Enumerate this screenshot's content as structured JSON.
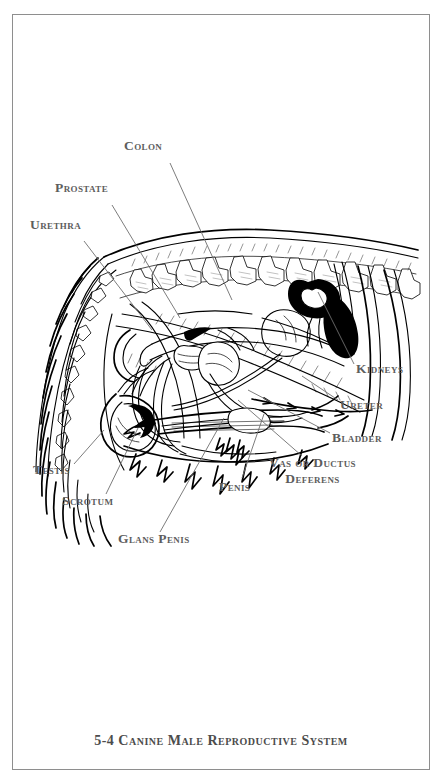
{
  "plate": {
    "caption": "5-4 Canine Male Reproductive System",
    "caption_number": "5-4",
    "caption_title": "Canine Male Reproductive System",
    "background_color": "#ffffff",
    "frame_color": "#8e8e8e",
    "label_color": "#5d5d5d",
    "ink_color": "#000000"
  },
  "labels": [
    {
      "id": "colon",
      "text": "Colon",
      "x": 124,
      "y": 145,
      "lead": [
        170,
        163,
        232,
        300
      ]
    },
    {
      "id": "prostate",
      "text": "Prostate",
      "x": 55,
      "y": 187,
      "lead": [
        112,
        205,
        180,
        318
      ]
    },
    {
      "id": "urethra",
      "text": "Urethra",
      "x": 30,
      "y": 224,
      "lead": [
        84,
        241,
        152,
        330
      ]
    },
    {
      "id": "kidneys",
      "text": "Kidneys",
      "x": 356,
      "y": 368,
      "lead": [
        354,
        368,
        320,
        290
      ]
    },
    {
      "id": "ureter",
      "text": "Ureter",
      "x": 340,
      "y": 404,
      "lead": [
        338,
        404,
        300,
        372
      ]
    },
    {
      "id": "bladder",
      "text": "Bladder",
      "x": 332,
      "y": 437,
      "lead": [
        330,
        437,
        246,
        392
      ]
    },
    {
      "id": "vas-deferens",
      "text": "Vas or Ductus\nDeferens",
      "x": 269,
      "y": 461,
      "lead": [
        300,
        458,
        236,
        400
      ]
    },
    {
      "id": "testis",
      "text": "Testis",
      "x": 33,
      "y": 469,
      "lead": [
        72,
        468,
        100,
        432
      ]
    },
    {
      "id": "scrotum",
      "text": "Scrotum",
      "x": 62,
      "y": 500,
      "lead": [
        104,
        498,
        136,
        430
      ]
    },
    {
      "id": "glans-penis",
      "text": "Glans Penis",
      "x": 118,
      "y": 538,
      "lead": [
        158,
        536,
        222,
        418
      ]
    },
    {
      "id": "penis",
      "text": "Penis",
      "x": 219,
      "y": 486,
      "lead": [
        240,
        482,
        262,
        414
      ]
    }
  ],
  "anatomy_parts": [
    "colon",
    "prostate",
    "urethra",
    "kidneys",
    "ureter",
    "bladder",
    "vas or ductus deferens",
    "testis",
    "scrotum",
    "glans penis",
    "penis"
  ],
  "figure": {
    "orientation": "hindquarters facing left, tail at left, ribs at right"
  }
}
